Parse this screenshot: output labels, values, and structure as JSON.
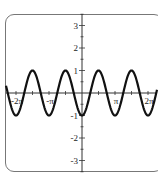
{
  "chart_data": {
    "type": "line",
    "title": "",
    "function": "y = -cos(2x)",
    "xlabel": "",
    "ylabel": "",
    "xlim": [
      -6.6,
      7.0
    ],
    "ylim": [
      -3.5,
      3.5
    ],
    "grid": false,
    "legend": null,
    "x_ticks": [
      {
        "value": -6.2832,
        "label": "-2π"
      },
      {
        "value": -3.1416,
        "label": "-π"
      },
      {
        "value": 3.1416,
        "label": "π"
      },
      {
        "value": 6.2832,
        "label": "2π"
      }
    ],
    "y_ticks": [
      {
        "value": 3,
        "label": "3"
      },
      {
        "value": 2,
        "label": "2"
      },
      {
        "value": 1,
        "label": "1"
      },
      {
        "value": -1,
        "label": "-1"
      },
      {
        "value": -2,
        "label": "-2"
      },
      {
        "value": -3,
        "label": "-3"
      }
    ],
    "series": [
      {
        "name": "y = -cos(2x)",
        "x": [
          -6.2832,
          -4.7124,
          -3.1416,
          -1.5708,
          0,
          1.5708,
          3.1416,
          4.7124,
          6.2832
        ],
        "y": [
          -1,
          1,
          -1,
          1,
          -1,
          1,
          -1,
          1,
          -1
        ]
      }
    ],
    "colors": {
      "curve": "#111111",
      "axes": "#333333",
      "frame": "#777777"
    }
  }
}
